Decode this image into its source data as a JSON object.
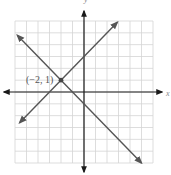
{
  "chart_data": {
    "type": "line",
    "title": "",
    "xlabel": "x",
    "ylabel": "y",
    "xlim": [
      -6,
      6
    ],
    "ylim": [
      -6,
      6
    ],
    "grid": true,
    "legend": null,
    "series": [
      {
        "name": "y = x + 3",
        "slope": 1,
        "intercept": 3,
        "x": [
          -5.6,
          2.9
        ],
        "y": [
          -2.6,
          5.9
        ],
        "arrows": "both"
      },
      {
        "name": "y = -x - 1",
        "slope": -1,
        "intercept": -1,
        "x": [
          -5.8,
          5
        ],
        "y": [
          4.8,
          -6
        ],
        "arrows": "both"
      }
    ],
    "annotations": [
      {
        "text": "(−2, 1)",
        "x": -2,
        "y": 1,
        "marker": "point"
      }
    ]
  },
  "labels": {
    "point": "(−2, 1)",
    "y_axis": "y",
    "x_axis": "x"
  },
  "colors": {
    "grid": "#d4d4d4",
    "axis": "#1a1a1a",
    "line": "#555555",
    "point": "#444444"
  }
}
